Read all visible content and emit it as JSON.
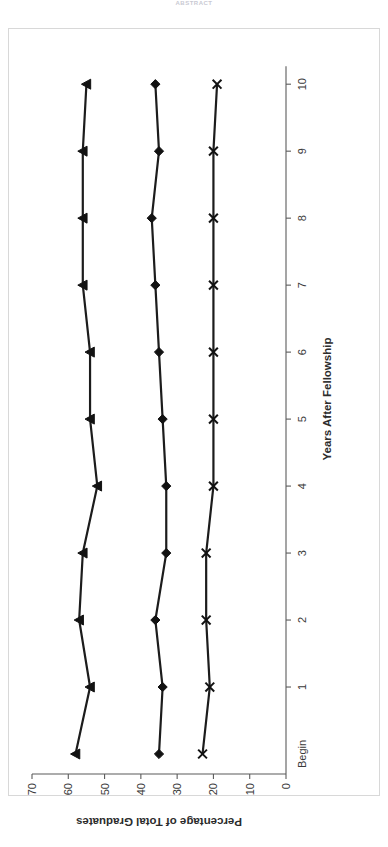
{
  "page": {
    "top_stamp": "ABSTRACT"
  },
  "chart_data": {
    "type": "line",
    "title": "",
    "xlabel": "Years After Fellowship",
    "ylabel": "Percentage of Total Graduates",
    "categories": [
      "Begin",
      "1",
      "2",
      "3",
      "4",
      "5",
      "6",
      "7",
      "8",
      "9",
      "10"
    ],
    "ylim": [
      0,
      70
    ],
    "yticks": [
      0,
      10,
      20,
      30,
      40,
      50,
      60,
      70
    ],
    "grid": false,
    "legend": "none",
    "series": [
      {
        "name": "Series 1",
        "marker": "triangle",
        "values": [
          58,
          54,
          57,
          56,
          52,
          54,
          54,
          56,
          56,
          56,
          55
        ]
      },
      {
        "name": "Series 2",
        "marker": "diamond",
        "values": [
          35,
          34,
          36,
          33,
          33,
          34,
          35,
          36,
          37,
          35,
          36
        ]
      },
      {
        "name": "Series 3",
        "marker": "x",
        "values": [
          23,
          21,
          22,
          22,
          20,
          20,
          20,
          20,
          20,
          20,
          19
        ]
      }
    ]
  }
}
